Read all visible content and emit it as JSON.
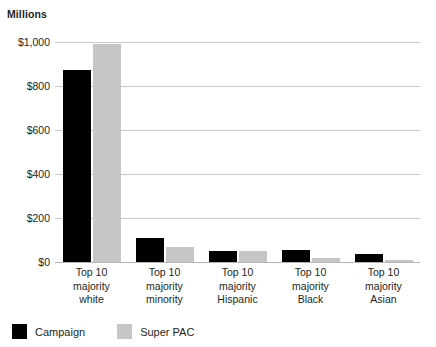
{
  "chart_data": {
    "type": "bar",
    "title": "",
    "units_label": "Millions",
    "xlabel": "",
    "ylabel": "",
    "ylim": [
      0,
      1000
    ],
    "ytick_values": [
      0,
      200,
      400,
      600,
      800,
      1000
    ],
    "ytick_labels": [
      "$0",
      "$200",
      "$400",
      "$600",
      "$800",
      "$1,000"
    ],
    "grid": true,
    "legend_position": "bottom-left",
    "categories": [
      "Top 10 majority white",
      "Top 10 majority minority",
      "Top 10 majority Hispanic",
      "Top 10 majority Black",
      "Top 10 majority Asian"
    ],
    "category_lines": [
      [
        "Top 10",
        "majority",
        "white"
      ],
      [
        "Top 10",
        "majority",
        "minority"
      ],
      [
        "Top 10",
        "majority",
        "Hispanic"
      ],
      [
        "Top 10",
        "majority",
        "Black"
      ],
      [
        "Top 10",
        "majority",
        "Asian"
      ]
    ],
    "series": [
      {
        "name": "Campaign",
        "color": "#000000",
        "values": [
          872,
          110,
          52,
          55,
          38
        ]
      },
      {
        "name": "Super PAC",
        "color": "#c6c6c6",
        "values": [
          990,
          68,
          50,
          18,
          8
        ]
      }
    ]
  },
  "legend": {
    "items": [
      {
        "label": "Campaign",
        "color": "#000000"
      },
      {
        "label": "Super PAC",
        "color": "#c6c6c6"
      }
    ]
  }
}
